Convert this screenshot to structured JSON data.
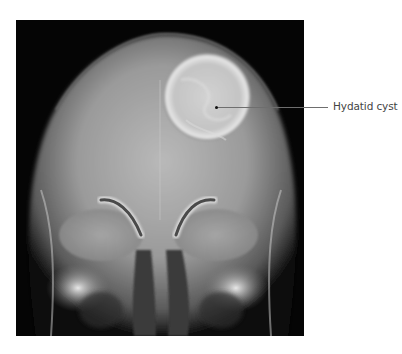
{
  "figure": {
    "annotations": [
      {
        "label": "Hydatid cyst",
        "line_color": "#6e6e6e",
        "text_color": "#444444"
      }
    ]
  }
}
